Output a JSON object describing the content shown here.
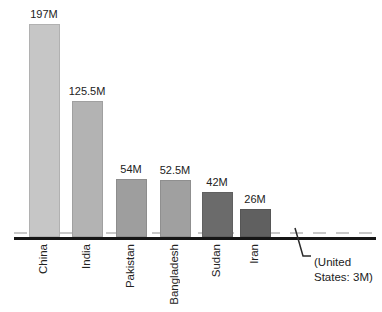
{
  "chart_data": {
    "type": "bar",
    "title": "",
    "categories": [
      "China",
      "India",
      "Pakistan",
      "Bangladesh",
      "Sudan",
      "Iran"
    ],
    "values": [
      197,
      125.5,
      54,
      52.5,
      42,
      26
    ],
    "value_labels": [
      "197M",
      "125.5M",
      "54M",
      "52.5M",
      "42M",
      "26M"
    ],
    "unit": "M (millions)",
    "bar_colors": [
      "#c6c6c6",
      "#b3b3b3",
      "#9e9e9e",
      "#a0a0a0",
      "#6b6b6b",
      "#606060"
    ],
    "axis_color": "#161616",
    "text_color": "#222222",
    "xlabel": "",
    "ylabel": "",
    "ylim": [
      0,
      220
    ],
    "grid": false,
    "legend": false,
    "reference_line": {
      "label": "United States",
      "value": 3,
      "style": "dashed",
      "color": "#c8c8c8"
    },
    "annotation": {
      "line1": "(United",
      "line2": "States: 3M)"
    }
  }
}
